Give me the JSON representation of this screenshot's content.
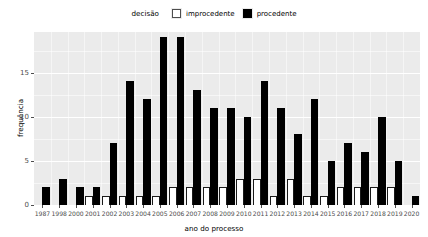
{
  "chart_data": {
    "type": "bar",
    "title": "",
    "subtitle": "",
    "xlabel": "ano do processo",
    "ylabel": "frequência",
    "legend_title": "decisão",
    "legend_position": "top",
    "grid": true,
    "ylim": [
      0,
      19.6
    ],
    "yticks": [
      0,
      5,
      10,
      15
    ],
    "ytick_labels": [
      "0",
      "5",
      "10",
      "15"
    ],
    "categories": [
      "1987",
      "1998",
      "2000",
      "2001",
      "2002",
      "2003",
      "2004",
      "2005",
      "2006",
      "2007",
      "2008",
      "2009",
      "2010",
      "2011",
      "2012",
      "2013",
      "2014",
      "2015",
      "2016",
      "2017",
      "2018",
      "2019",
      "2020"
    ],
    "series": [
      {
        "name": "improcedente",
        "color": "#ffffff",
        "border": "#1a1a1a",
        "values": [
          0,
          0,
          0,
          1,
          1,
          1,
          1,
          1,
          2,
          2,
          2,
          2,
          3,
          3,
          1,
          3,
          1,
          1,
          2,
          2,
          2,
          2,
          0
        ]
      },
      {
        "name": "procedente",
        "color": "#000000",
        "values": [
          2,
          3,
          2,
          2,
          7,
          14,
          12,
          19,
          19,
          13,
          11,
          11,
          10,
          14,
          11,
          8,
          12,
          5,
          7,
          6,
          10,
          5,
          1
        ]
      }
    ]
  },
  "legend": {
    "title": "decisão",
    "items": [
      {
        "label": "improcedente",
        "swatch": "white-square"
      },
      {
        "label": "procedente",
        "swatch": "black-square"
      }
    ]
  },
  "axes": {
    "y": {
      "label": "frequência",
      "ticks": [
        "0",
        "5",
        "10",
        "15"
      ]
    },
    "x": {
      "label": "ano do processo",
      "ticks": [
        "1987",
        "1998",
        "2000",
        "2001",
        "2002",
        "2003",
        "2004",
        "2005",
        "2006",
        "2007",
        "2008",
        "2009",
        "2010",
        "2011",
        "2012",
        "2013",
        "2014",
        "2015",
        "2016",
        "2017",
        "2018",
        "2019",
        "2020"
      ]
    }
  },
  "colors": {
    "panel_background": "#ebebeb",
    "grid": "#ffffff",
    "procedente": "#000000",
    "improcedente": "#ffffff",
    "axis_text": "#4d4d4d"
  }
}
